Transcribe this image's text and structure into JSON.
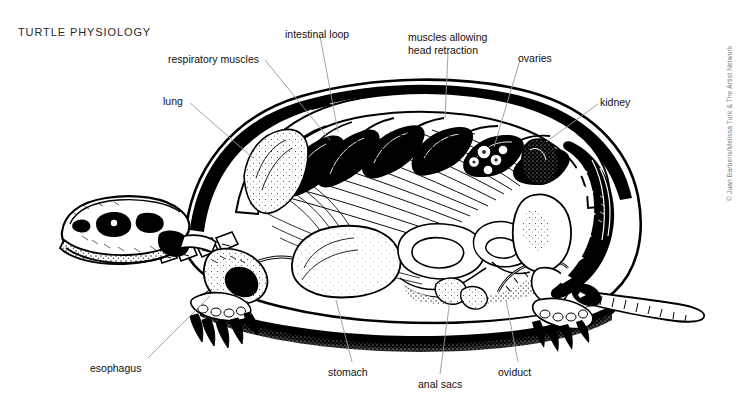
{
  "figure": {
    "title": "TURTLE PHYSIOLOGY",
    "credit": "© Juan Barberis/Melissa Turk & The Artist Network",
    "style": "pen-and-ink stipple line engraving",
    "background_color": "#ffffff",
    "ink_color": "#000000",
    "leader_color": "#9a9a9a",
    "title_color": "#2b2b2b",
    "credit_color": "#7d7d7d",
    "width": 750,
    "height": 402
  },
  "labels": [
    {
      "id": "respiratory-muscles",
      "text": "respiratory muscles",
      "x": 168,
      "y": 53,
      "align": "l",
      "leader": [
        [
          265,
          60
        ],
        [
          330,
          140
        ]
      ]
    },
    {
      "id": "intestinal-loop",
      "text": "intestinal loop",
      "x": 285,
      "y": 28,
      "align": "l",
      "leader": [
        [
          320,
          36
        ],
        [
          338,
          132
        ]
      ]
    },
    {
      "id": "muscles-allowing-head-retraction",
      "text": "muscles allowing\nhead retraction",
      "x": 408,
      "y": 31,
      "align": "l",
      "leader": [
        [
          448,
          53
        ],
        [
          445,
          118
        ]
      ]
    },
    {
      "id": "ovaries",
      "text": "ovaries",
      "x": 518,
      "y": 52,
      "align": "l",
      "leader": [
        [
          520,
          60
        ],
        [
          494,
          147
        ]
      ]
    },
    {
      "id": "kidney",
      "text": "kidney",
      "x": 600,
      "y": 96,
      "align": "l",
      "leader": [
        [
          598,
          104
        ],
        [
          546,
          142
        ]
      ]
    },
    {
      "id": "lung",
      "text": "lung",
      "x": 163,
      "y": 95,
      "align": "l",
      "leader": [
        [
          190,
          103
        ],
        [
          253,
          158
        ]
      ]
    },
    {
      "id": "esophagus",
      "text": "esophagus",
      "x": 90,
      "y": 362,
      "align": "l",
      "leader": [
        [
          148,
          358
        ],
        [
          210,
          296
        ]
      ]
    },
    {
      "id": "stomach",
      "text": "stomach",
      "x": 328,
      "y": 366,
      "align": "l",
      "leader": [
        [
          352,
          362
        ],
        [
          336,
          300
        ]
      ]
    },
    {
      "id": "anal-sacs",
      "text": "anal sacs",
      "x": 418,
      "y": 378,
      "align": "l",
      "leader": [
        [
          440,
          374
        ],
        [
          450,
          300
        ]
      ]
    },
    {
      "id": "oviduct",
      "text": "oviduct",
      "x": 498,
      "y": 366,
      "align": "l",
      "leader": [
        [
          518,
          362
        ],
        [
          506,
          300
        ]
      ]
    }
  ]
}
